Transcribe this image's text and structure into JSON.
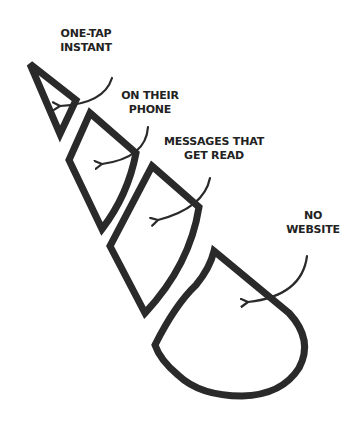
{
  "diagram": {
    "type": "stacked-segments-cone",
    "stroke_color": "#2a2a2a",
    "background": "#ffffff",
    "segments": [
      {
        "id": "one-tap-instant",
        "shape": "triangle",
        "label_lines": [
          "ONE-TAP",
          "INSTANT"
        ]
      },
      {
        "id": "on-their-phone",
        "shape": "rhombus",
        "label_lines": [
          "ON THEIR",
          "PHONE"
        ]
      },
      {
        "id": "messages-that-get-read",
        "shape": "kite",
        "label_lines": [
          "MESSAGES THAT",
          "GET READ"
        ]
      },
      {
        "id": "no-website",
        "shape": "teardrop",
        "label_lines": [
          "NO",
          "WEBSITE"
        ]
      }
    ]
  }
}
